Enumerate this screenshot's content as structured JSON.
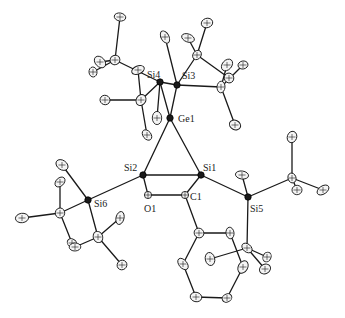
{
  "figure": {
    "type": "ORTEP molecular structure",
    "labels": {
      "Ge1": "Ge1",
      "Si1": "Si1",
      "Si2": "Si2",
      "Si3": "Si3",
      "Si4": "Si4",
      "Si5": "Si5",
      "Si6": "Si6",
      "O1": "O1",
      "C1": "C1"
    },
    "labeled_atoms": [
      "Ge1",
      "Si1",
      "Si2",
      "Si3",
      "Si4",
      "Si5",
      "Si6",
      "O1",
      "C1"
    ],
    "substituents": {
      "Si3": "tert-butyl x2",
      "Si4": "tert-butyl x2",
      "Si5": "tert-butyl x2",
      "Si6": "tert-butyl x2",
      "C1": "phenyl"
    },
    "colors": {
      "ink": "#1a1a1a",
      "background": "#ffffff",
      "ellipsoid_fill": "#f4f4f4"
    }
  }
}
